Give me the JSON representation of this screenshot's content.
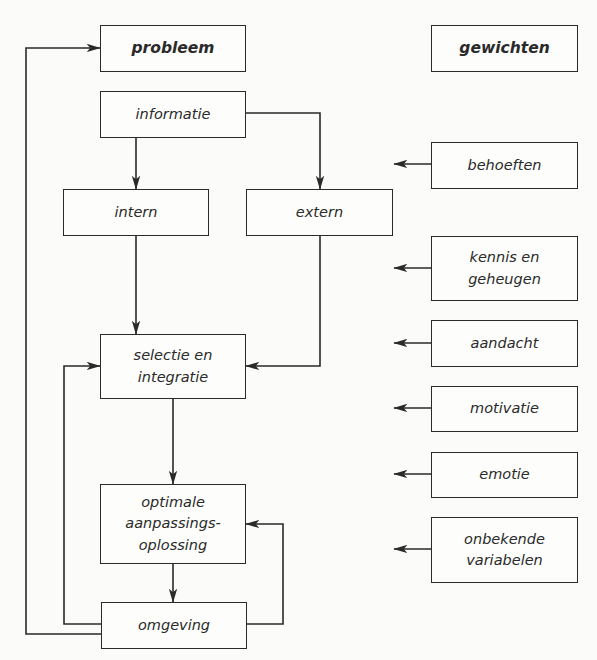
{
  "diagram": {
    "left_column_header": "probleem",
    "right_column_header": "gewichten",
    "nodes": {
      "informatie": "informatie",
      "intern": "intern",
      "extern": "extern",
      "selectie": "selectie en integratie",
      "optimale": "optimale aanpassings-oplossing",
      "omgeving": "omgeving"
    },
    "weights": [
      "behoeften",
      "kennis en geheugen",
      "aandacht",
      "motivatie",
      "emotie",
      "onbekende variabelen"
    ],
    "edges": [
      {
        "from": "informatie",
        "to": "intern"
      },
      {
        "from": "informatie",
        "to": "extern"
      },
      {
        "from": "intern",
        "to": "selectie"
      },
      {
        "from": "extern",
        "to": "selectie"
      },
      {
        "from": "selectie",
        "to": "optimale"
      },
      {
        "from": "optimale",
        "to": "omgeving"
      },
      {
        "from": "omgeving",
        "to": "selectie"
      },
      {
        "from": "omgeving",
        "to": "optimale"
      },
      {
        "from": "omgeving",
        "to": "probleem"
      }
    ],
    "colors": {
      "line": "#2a2a2a",
      "background": "#fbfbf9"
    }
  }
}
